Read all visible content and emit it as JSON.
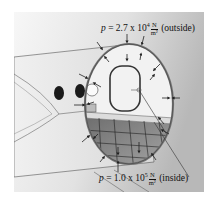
{
  "diagram": {
    "labels": {
      "outside": {
        "var": "p",
        "eq": " = 2.7 x 10",
        "exp": "4",
        "unit_num": "N",
        "unit_den": "m²",
        "suffix": " (outside)"
      },
      "inside": {
        "var": "p",
        "eq": " = 1.0 x 10",
        "exp": "5",
        "unit_num": "N",
        "unit_den": "m²",
        "suffix": " (inside)"
      }
    },
    "colors": {
      "background_light": "#f4f4f4",
      "background_dark": "#bdbdbd",
      "fuselage": "#e6e6e6",
      "outline": "#333333",
      "floor_grid": "#8a8a8a"
    }
  }
}
